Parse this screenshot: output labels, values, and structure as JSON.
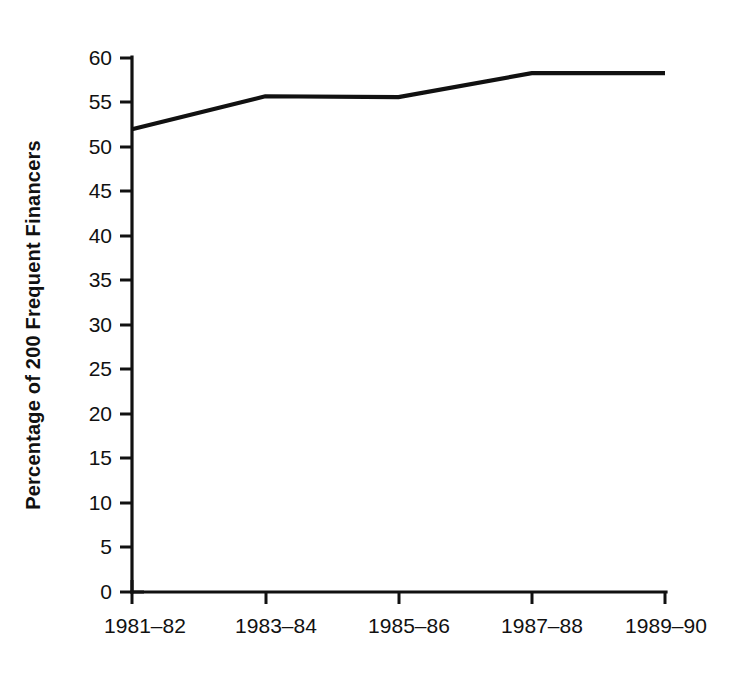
{
  "chart_data": {
    "type": "line",
    "title": "",
    "subtitle": "",
    "xlabel": "",
    "ylabel": "Percentage of 200 Frequent Financers",
    "categories": [
      "1981–82",
      "1983–84",
      "1985–86",
      "1987–88",
      "1989–90"
    ],
    "values": [
      52.0,
      55.7,
      55.6,
      58.3,
      58.3
    ],
    "series": [
      {
        "name": "Percentage of 200 Frequent Financers",
        "values": [
          52.0,
          55.7,
          55.6,
          58.3,
          58.3
        ]
      }
    ],
    "ylim": [
      0,
      60
    ],
    "yticks": [
      0,
      5,
      10,
      15,
      20,
      25,
      30,
      35,
      40,
      45,
      50,
      55,
      60
    ],
    "ytick_labels": [
      "0",
      "5",
      "10",
      "15",
      "20",
      "25",
      "30",
      "35",
      "40",
      "45",
      "50",
      "55",
      "60"
    ],
    "xtick_labels": [
      "1981–82",
      "1983–84",
      "1985–86",
      "1987–88",
      "1989–90"
    ],
    "grid": false,
    "legend": false,
    "legend_position": "none",
    "line_color": "#111111",
    "background_color": "#ffffff",
    "annotations": []
  },
  "axes": {
    "y_axis_title": "Percentage of 200 Frequent Financers",
    "y_tick_0": "0",
    "y_tick_5": "5",
    "y_tick_10": "10",
    "y_tick_15": "15",
    "y_tick_20": "20",
    "y_tick_25": "25",
    "y_tick_30": "30",
    "y_tick_35": "35",
    "y_tick_40": "40",
    "y_tick_45": "45",
    "y_tick_50": "50",
    "y_tick_55": "55",
    "y_tick_60": "60",
    "x_tick_1": "1981–82",
    "x_tick_2": "1983–84",
    "x_tick_3": "1985–86",
    "x_tick_4": "1987–88",
    "x_tick_5": "1989–90"
  }
}
